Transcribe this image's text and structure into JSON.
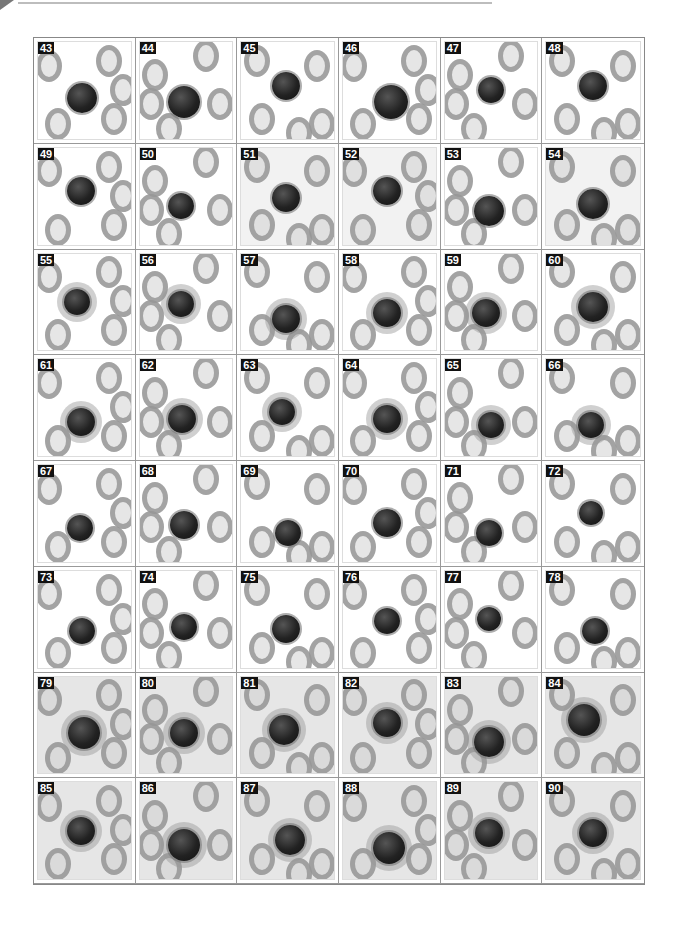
{
  "figure": {
    "panels": [
      {
        "n": "43",
        "cx": 48,
        "cy": 58,
        "r": 15,
        "shade": "light",
        "halo": false
      },
      {
        "n": "44",
        "cx": 48,
        "cy": 62,
        "r": 16,
        "shade": "light",
        "halo": false
      },
      {
        "n": "45",
        "cx": 48,
        "cy": 45,
        "r": 14,
        "shade": "light",
        "halo": false
      },
      {
        "n": "46",
        "cx": 52,
        "cy": 62,
        "r": 17,
        "shade": "light",
        "halo": false
      },
      {
        "n": "47",
        "cx": 50,
        "cy": 50,
        "r": 13,
        "shade": "light",
        "halo": false
      },
      {
        "n": "48",
        "cx": 50,
        "cy": 45,
        "r": 14,
        "shade": "light",
        "halo": false
      },
      {
        "n": "49",
        "cx": 46,
        "cy": 45,
        "r": 14,
        "shade": "light",
        "halo": false
      },
      {
        "n": "50",
        "cx": 45,
        "cy": 60,
        "r": 13,
        "shade": "light",
        "halo": false
      },
      {
        "n": "51",
        "cx": 48,
        "cy": 52,
        "r": 14,
        "shade": "medium",
        "halo": false
      },
      {
        "n": "52",
        "cx": 48,
        "cy": 45,
        "r": 14,
        "shade": "medium",
        "halo": false
      },
      {
        "n": "53",
        "cx": 48,
        "cy": 65,
        "r": 15,
        "shade": "light",
        "halo": false
      },
      {
        "n": "54",
        "cx": 50,
        "cy": 58,
        "r": 15,
        "shade": "medium",
        "halo": false
      },
      {
        "n": "55",
        "cx": 42,
        "cy": 50,
        "r": 13,
        "shade": "light",
        "halo": true
      },
      {
        "n": "56",
        "cx": 45,
        "cy": 52,
        "r": 13,
        "shade": "light",
        "halo": true
      },
      {
        "n": "57",
        "cx": 48,
        "cy": 68,
        "r": 14,
        "shade": "light",
        "halo": true
      },
      {
        "n": "58",
        "cx": 48,
        "cy": 62,
        "r": 14,
        "shade": "light",
        "halo": true
      },
      {
        "n": "59",
        "cx": 45,
        "cy": 62,
        "r": 14,
        "shade": "light",
        "halo": true
      },
      {
        "n": "60",
        "cx": 50,
        "cy": 55,
        "r": 15,
        "shade": "light",
        "halo": true
      },
      {
        "n": "61",
        "cx": 46,
        "cy": 65,
        "r": 14,
        "shade": "light",
        "halo": true
      },
      {
        "n": "62",
        "cx": 46,
        "cy": 62,
        "r": 14,
        "shade": "light",
        "halo": true
      },
      {
        "n": "63",
        "cx": 44,
        "cy": 55,
        "r": 13,
        "shade": "light",
        "halo": true
      },
      {
        "n": "64",
        "cx": 48,
        "cy": 62,
        "r": 14,
        "shade": "light",
        "halo": true
      },
      {
        "n": "65",
        "cx": 50,
        "cy": 68,
        "r": 13,
        "shade": "light",
        "halo": true
      },
      {
        "n": "66",
        "cx": 48,
        "cy": 68,
        "r": 13,
        "shade": "light",
        "halo": true
      },
      {
        "n": "67",
        "cx": 45,
        "cy": 65,
        "r": 13,
        "shade": "light",
        "halo": false
      },
      {
        "n": "68",
        "cx": 48,
        "cy": 62,
        "r": 14,
        "shade": "light",
        "halo": false
      },
      {
        "n": "69",
        "cx": 50,
        "cy": 70,
        "r": 13,
        "shade": "light",
        "halo": false
      },
      {
        "n": "70",
        "cx": 48,
        "cy": 60,
        "r": 14,
        "shade": "light",
        "halo": false
      },
      {
        "n": "71",
        "cx": 48,
        "cy": 70,
        "r": 13,
        "shade": "light",
        "halo": false
      },
      {
        "n": "72",
        "cx": 48,
        "cy": 50,
        "r": 12,
        "shade": "light",
        "halo": false
      },
      {
        "n": "73",
        "cx": 48,
        "cy": 62,
        "r": 13,
        "shade": "light",
        "halo": false
      },
      {
        "n": "74",
        "cx": 48,
        "cy": 58,
        "r": 13,
        "shade": "light",
        "halo": false
      },
      {
        "n": "75",
        "cx": 48,
        "cy": 60,
        "r": 14,
        "shade": "light",
        "halo": false
      },
      {
        "n": "76",
        "cx": 48,
        "cy": 52,
        "r": 13,
        "shade": "light",
        "halo": false
      },
      {
        "n": "77",
        "cx": 48,
        "cy": 50,
        "r": 12,
        "shade": "light",
        "halo": false
      },
      {
        "n": "78",
        "cx": 52,
        "cy": 62,
        "r": 13,
        "shade": "light",
        "halo": false
      },
      {
        "n": "79",
        "cx": 50,
        "cy": 58,
        "r": 16,
        "shade": "dark",
        "halo": true
      },
      {
        "n": "80",
        "cx": 48,
        "cy": 58,
        "r": 14,
        "shade": "dark",
        "halo": true
      },
      {
        "n": "81",
        "cx": 46,
        "cy": 55,
        "r": 15,
        "shade": "dark",
        "halo": true
      },
      {
        "n": "82",
        "cx": 48,
        "cy": 48,
        "r": 14,
        "shade": "dark",
        "halo": true
      },
      {
        "n": "83",
        "cx": 48,
        "cy": 68,
        "r": 15,
        "shade": "dark",
        "halo": true
      },
      {
        "n": "84",
        "cx": 40,
        "cy": 45,
        "r": 16,
        "shade": "dark",
        "halo": true
      },
      {
        "n": "85",
        "cx": 46,
        "cy": 50,
        "r": 14,
        "shade": "dark",
        "halo": true
      },
      {
        "n": "86",
        "cx": 48,
        "cy": 65,
        "r": 16,
        "shade": "dark",
        "halo": true
      },
      {
        "n": "87",
        "cx": 52,
        "cy": 60,
        "r": 15,
        "shade": "dark",
        "halo": true
      },
      {
        "n": "88",
        "cx": 50,
        "cy": 68,
        "r": 16,
        "shade": "dark",
        "halo": true
      },
      {
        "n": "89",
        "cx": 48,
        "cy": 52,
        "r": 14,
        "shade": "dark",
        "halo": true
      },
      {
        "n": "90",
        "cx": 50,
        "cy": 52,
        "r": 14,
        "shade": "dark",
        "halo": true
      }
    ]
  }
}
